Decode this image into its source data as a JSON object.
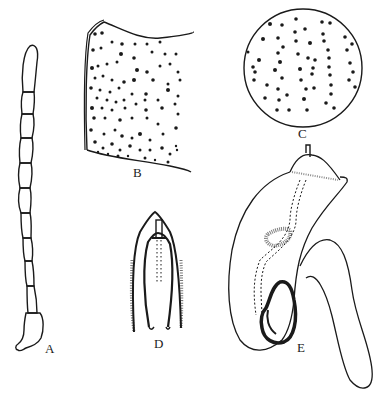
{
  "figure": {
    "panels": [
      {
        "id": "A",
        "label": "A",
        "description": "antenna"
      },
      {
        "id": "B",
        "label": "B",
        "description": "punctured surface fragment"
      },
      {
        "id": "C",
        "label": "C",
        "description": "circular detail of punctation"
      },
      {
        "id": "D",
        "label": "D",
        "description": "tip structure"
      },
      {
        "id": "E",
        "label": "E",
        "description": "genitalia"
      }
    ],
    "ink_color": "#1a1a1a",
    "background": "#ffffff"
  }
}
